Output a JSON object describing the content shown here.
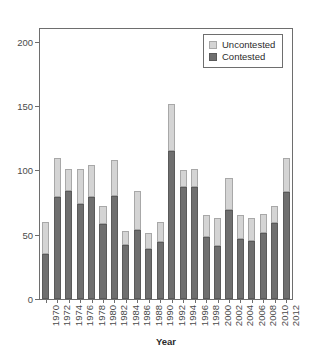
{
  "chart_data": {
    "type": "bar",
    "barmode": "stacked",
    "title": "",
    "xlabel": "Year",
    "ylabel": "",
    "ylim": [
      0,
      210
    ],
    "yticks": [
      0,
      50,
      100,
      150,
      200
    ],
    "ytick_labels": [
      "0",
      "50",
      "100",
      "150",
      "200"
    ],
    "grid": false,
    "legend_position": "top-right",
    "categories": [
      "1970",
      "1971",
      "1972",
      "1973",
      "1974",
      "1975",
      "1976",
      "1977",
      "1978",
      "1979",
      "1980",
      "1981",
      "1982",
      "1983",
      "1984",
      "1985",
      "1986",
      "1987",
      "1988",
      "1989",
      "1990",
      "1991"
    ],
    "tick_labels": [
      "1970",
      "1972",
      "1974",
      "1976",
      "1978",
      "1980",
      "1982",
      "1984",
      "1986",
      "1988",
      "1990",
      "1992",
      "1994",
      "1996",
      "1998",
      "2000",
      "2002",
      "2004",
      "2006",
      "2008",
      "2010",
      "2012"
    ],
    "series": [
      {
        "name": "Contested",
        "color": "#6f6f6f",
        "values": [
          35,
          79,
          84,
          74,
          79,
          58,
          80,
          42,
          54,
          39,
          44,
          115,
          87,
          87,
          48,
          41,
          69,
          47,
          45,
          51,
          59,
          83
        ]
      },
      {
        "name": "Uncontested",
        "color": "#d4d4d4",
        "values": [
          25,
          31,
          17,
          27,
          25,
          14,
          28,
          11,
          30,
          12,
          16,
          37,
          13,
          14,
          17,
          22,
          25,
          18,
          18,
          15,
          13,
          27
        ]
      }
    ],
    "totals": [
      60,
      110,
      101,
      101,
      104,
      72,
      108,
      53,
      84,
      51,
      60,
      152,
      100,
      101,
      65,
      63,
      94,
      65,
      63,
      66,
      72,
      110
    ]
  },
  "legend": {
    "items": [
      {
        "label": "Uncontested",
        "swatch": "uncontested-swatch"
      },
      {
        "label": "Contested",
        "swatch": "contested-swatch"
      }
    ]
  },
  "axis": {
    "x_title": "Year"
  }
}
